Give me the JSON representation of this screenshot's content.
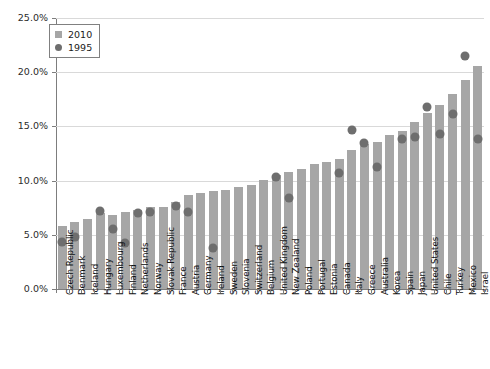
{
  "chart_data": {
    "type": "bar",
    "title": "",
    "subtitle": "",
    "xlabel": "",
    "ylabel": "",
    "ylim": [
      0,
      25
    ],
    "ytick_values": [
      0,
      5,
      10,
      15,
      20,
      25
    ],
    "ytick_labels": [
      "0.0%",
      "5.0%",
      "10.0%",
      "15.0%",
      "20.0%",
      "25.0%"
    ],
    "grid": true,
    "legend_position": "top-left",
    "legend": [
      "2010",
      "1995"
    ],
    "categories": [
      "Czech Republic",
      "Denmark",
      "Iceland",
      "Hungary",
      "Luxembourg",
      "Finland",
      "Netherlands",
      "Norway",
      "Slovak Republic",
      "France",
      "Austria",
      "Germany",
      "Ireland",
      "Sweden",
      "Slovenia",
      "Switzerland",
      "Belgium",
      "United Kingdom",
      "New Zealand",
      "Poland",
      "Portugal",
      "Estonia",
      "Canada",
      "Italy",
      "Greece",
      "Australia",
      "Korea",
      "Spain",
      "Japan",
      "United States",
      "Chile",
      "Turkey",
      "Mexico",
      "Israel"
    ],
    "series": [
      {
        "name": "2010",
        "marker": "bar",
        "color": "#a6a6a6",
        "values": [
          5.8,
          6.2,
          6.5,
          7.0,
          6.8,
          7.1,
          7.3,
          7.6,
          7.6,
          8.0,
          8.7,
          8.9,
          9.0,
          9.1,
          9.4,
          9.6,
          10.1,
          10.5,
          10.8,
          11.1,
          11.5,
          11.7,
          12.0,
          12.8,
          13.4,
          13.6,
          14.2,
          14.6,
          15.4,
          16.2,
          17.0,
          18.0,
          19.3,
          20.6
        ]
      },
      {
        "name": "1995",
        "marker": "circle",
        "color": "#6e6e6e",
        "values": [
          4.3,
          4.8,
          null,
          7.2,
          5.5,
          4.2,
          7.0,
          7.1,
          null,
          7.7,
          7.1,
          null,
          3.8,
          null,
          null,
          null,
          null,
          10.3,
          8.4,
          null,
          null,
          null,
          10.7,
          14.7,
          13.5,
          11.3,
          null,
          13.8,
          14.0,
          16.8,
          14.3,
          16.1,
          21.5,
          13.8
        ]
      }
    ]
  },
  "legend_items": [
    {
      "label": "2010",
      "icon": "square-swatch"
    },
    {
      "label": "1995",
      "icon": "circle-swatch"
    }
  ]
}
